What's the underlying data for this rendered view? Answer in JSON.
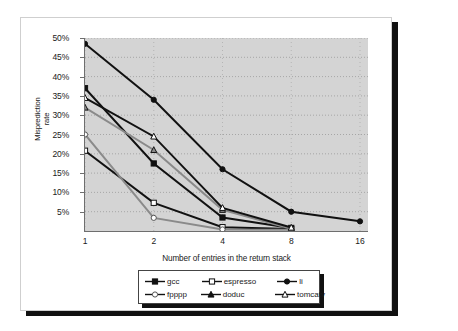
{
  "chart_data": {
    "type": "line",
    "title": "",
    "xlabel": "Number of entries in the return stack",
    "ylabel": "Misprediction rate",
    "ylabel_lines": [
      "Misprediction",
      "rate"
    ],
    "categories": [
      "1",
      "2",
      "4",
      "8",
      "16"
    ],
    "x_tick_labels": [
      "1",
      "2",
      "4",
      "8",
      "16"
    ],
    "y_tick_labels": [
      "5%",
      "10%",
      "15%",
      "20%",
      "25%",
      "30%",
      "35%",
      "40%",
      "45%",
      "50%"
    ],
    "y_tick_values": [
      5,
      10,
      15,
      20,
      25,
      30,
      35,
      40,
      45,
      50
    ],
    "ylim": [
      0,
      50
    ],
    "y_unit": "%",
    "grid": "dotted-horizontal-and-vertical",
    "legend_position": "below-axes",
    "plot_background": "#d4d4d4",
    "series": [
      {
        "name": "gcc",
        "marker": "filled-square",
        "color": "#111111",
        "values": [
          37.0,
          17.5,
          3.5,
          0.8,
          null
        ],
        "points": [
          {
            "x": "1",
            "y": 37.0
          },
          {
            "x": "2",
            "y": 17.5
          },
          {
            "x": "4",
            "y": 3.5
          },
          {
            "x": "8",
            "y": 0.8
          }
        ]
      },
      {
        "name": "espresso",
        "marker": "open-square",
        "color": "#111111",
        "values": [
          20.8,
          7.3,
          1.0,
          0.5,
          null
        ],
        "points": [
          {
            "x": "1",
            "y": 20.8
          },
          {
            "x": "2",
            "y": 7.3
          },
          {
            "x": "4",
            "y": 1.0
          },
          {
            "x": "8",
            "y": 0.5
          }
        ]
      },
      {
        "name": "li",
        "marker": "filled-circle",
        "color": "#111111",
        "values": [
          48.5,
          34.0,
          16.0,
          5.0,
          2.5
        ],
        "points": [
          {
            "x": "1",
            "y": 48.5
          },
          {
            "x": "2",
            "y": 34.0
          },
          {
            "x": "4",
            "y": 16.0
          },
          {
            "x": "8",
            "y": 5.0
          },
          {
            "x": "16",
            "y": 2.5
          }
        ]
      },
      {
        "name": "fpppp",
        "marker": "open-circle",
        "color": "#8a8a8a",
        "values": [
          25.0,
          3.4,
          0.4,
          0.3,
          null
        ],
        "points": [
          {
            "x": "1",
            "y": 25.0
          },
          {
            "x": "2",
            "y": 3.4
          },
          {
            "x": "4",
            "y": 0.4
          },
          {
            "x": "8",
            "y": 0.3
          }
        ]
      },
      {
        "name": "doduc",
        "marker": "filled-triangle",
        "color": "#8a8a8a",
        "values": [
          32.0,
          21.0,
          5.5,
          0.6,
          null
        ],
        "points": [
          {
            "x": "1",
            "y": 32.0
          },
          {
            "x": "2",
            "y": 21.0
          },
          {
            "x": "4",
            "y": 5.5
          },
          {
            "x": "8",
            "y": 0.6
          }
        ]
      },
      {
        "name": "tomcatv",
        "marker": "open-triangle",
        "color": "#111111",
        "values": [
          34.5,
          24.5,
          6.0,
          0.9,
          null
        ],
        "points": [
          {
            "x": "1",
            "y": 34.5
          },
          {
            "x": "2",
            "y": 24.5
          },
          {
            "x": "4",
            "y": 6.0
          },
          {
            "x": "8",
            "y": 0.9
          }
        ]
      }
    ],
    "legend": [
      {
        "label": "gcc",
        "marker": "filled-square"
      },
      {
        "label": "espresso",
        "marker": "open-square"
      },
      {
        "label": "li",
        "marker": "filled-circle"
      },
      {
        "label": "fpppp",
        "marker": "open-circle"
      },
      {
        "label": "doduc",
        "marker": "filled-triangle"
      },
      {
        "label": "tomcatv",
        "marker": "open-triangle"
      }
    ]
  }
}
